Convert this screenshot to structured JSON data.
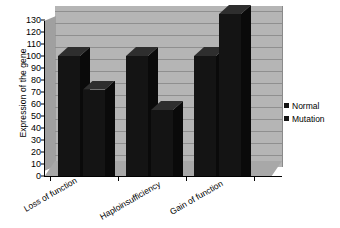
{
  "chart_data": {
    "type": "bar",
    "title": "",
    "subtitle": "",
    "xlabel": "",
    "ylabel": "Expression of the gene",
    "categories": [
      "Loss of function",
      "Haploinsufficiency",
      "Gain of function"
    ],
    "series": [
      {
        "name": "Normal",
        "values": [
          100,
          100,
          100
        ],
        "color": "#141414"
      },
      {
        "name": "Mutation",
        "values": [
          72,
          55,
          135
        ],
        "color": "#141414"
      }
    ],
    "ylim": [
      0,
      130
    ],
    "ytick_step": 10,
    "ytick_labels": [
      "130",
      "120",
      "110",
      "100",
      "90",
      "80",
      "70",
      "60",
      "50",
      "40",
      "30",
      "20",
      "10",
      "0"
    ],
    "ytick_values": [
      130,
      120,
      110,
      100,
      90,
      80,
      70,
      60,
      50,
      40,
      30,
      20,
      10,
      0
    ],
    "grid": true,
    "grid_axis": "y",
    "legend_position": "right",
    "style": "3d-column",
    "plot_background": "#b5b5b5",
    "bar_color": "#141414",
    "axis_color": "#000000",
    "gridline_color": "#8f8f8f"
  },
  "legend": {
    "items": [
      {
        "label": "Normal"
      },
      {
        "label": "Mutation"
      }
    ]
  }
}
